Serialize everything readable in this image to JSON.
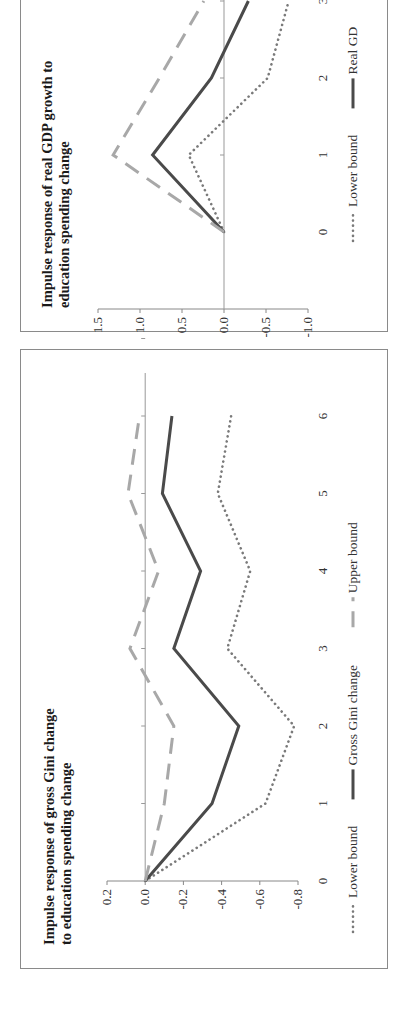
{
  "chart_data": [
    {
      "type": "line",
      "title": "Impulse response of gross Gini  change to education spending change",
      "title_lines": [
        "Impulse response of gross Gini  change",
        "to education spending change"
      ],
      "xlabel": "",
      "ylabel": "",
      "categories": [
        0,
        1,
        2,
        3,
        4,
        5,
        6
      ],
      "x_ticks": [
        "0",
        "1",
        "2",
        "3",
        "4",
        "5",
        "6"
      ],
      "y_ticks": [
        "0.2",
        "0.0",
        "-0.2",
        "-0.4",
        "-0.6",
        "-0.8"
      ],
      "ylim": [
        -0.8,
        0.2
      ],
      "grid": false,
      "legend_position": "bottom",
      "series": [
        {
          "name": "Lower bound",
          "style": "dotted",
          "color": "#7a7a7a",
          "values": [
            0.0,
            -0.63,
            -0.78,
            -0.43,
            -0.55,
            -0.38,
            -0.45
          ]
        },
        {
          "name": "Gross Gini change",
          "style": "solid",
          "color": "#4a4a4a",
          "values": [
            0.0,
            -0.35,
            -0.49,
            -0.15,
            -0.29,
            -0.09,
            -0.14
          ]
        },
        {
          "name": "Upper bound",
          "style": "dashed",
          "color": "#a8a8a8",
          "values": [
            0.0,
            -0.1,
            -0.15,
            0.08,
            -0.07,
            0.09,
            0.03
          ]
        }
      ]
    },
    {
      "type": "line",
      "title": "Impulse response of real GDP growth to education spending change",
      "title_lines": [
        "Impulse response of real GDP growth to",
        "education spending change"
      ],
      "xlabel": "",
      "ylabel": "",
      "categories": [
        0,
        1,
        2,
        3
      ],
      "x_ticks": [
        "0",
        "1",
        "2",
        "3"
      ],
      "y_ticks": [
        "1.5",
        "1.0",
        "0.5",
        "0.0",
        "-0.5",
        "-1.0"
      ],
      "ylim": [
        -1.0,
        1.5
      ],
      "grid": false,
      "legend_position": "bottom",
      "note": "Panel is cropped at the image edge after x=3",
      "series": [
        {
          "name": "Lower bound",
          "style": "dotted",
          "color": "#7a7a7a",
          "values": [
            0.0,
            0.42,
            -0.52,
            -0.77
          ]
        },
        {
          "name": "Real GDP",
          "style": "solid",
          "color": "#4a4a4a",
          "values": [
            0.0,
            0.85,
            0.15,
            -0.29
          ]
        },
        {
          "name": "Upper bound",
          "style": "dashed",
          "color": "#a8a8a8",
          "values": [
            0.0,
            1.32,
            0.77,
            0.24
          ]
        }
      ],
      "legend_visible": [
        "Lower bound",
        "Real GD"
      ]
    }
  ],
  "panels": {
    "gini": {
      "title_line1": "Impulse response of gross Gini  change",
      "title_line2": "to education spending change",
      "legend": [
        "Lower bound",
        "Gross Gini change",
        "Upper bound"
      ]
    },
    "gdp": {
      "title_line1": "Impulse response of real GDP growth to",
      "title_line2": "education spending change",
      "legend": [
        "Lower bound",
        "Real GD"
      ]
    }
  }
}
